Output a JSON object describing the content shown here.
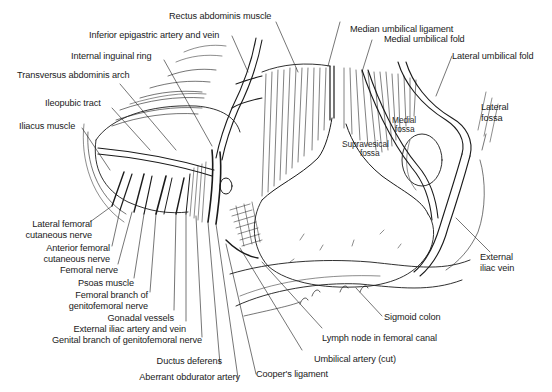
{
  "figure": {
    "type": "anatomical-line-drawing",
    "ink_color": "#1a1a1a",
    "background": "#ffffff"
  },
  "labels": {
    "rectus_abdominis": "Rectus abdominis muscle",
    "inferior_epigastric": "Inferior epigastric artery and vein",
    "internal_inguinal_ring": "Internal inguinal ring",
    "transversus_arch": "Transversus abdominis arch",
    "ileopubic_tract": "Ileopubic tract",
    "iliacus": "Iliacus muscle",
    "lat_fem_cut_1": "Lateral femoral",
    "lat_fem_cut_2": "cutaneous nerve",
    "ant_fem_cut_1": "Anterior femoral",
    "ant_fem_cut_2": "cutaneous nerve",
    "femoral_nerve": "Femoral nerve",
    "psoas": "Psoas muscle",
    "fem_branch_1": "Femoral branch of",
    "fem_branch_2": "genitofemoral nerve",
    "gonadal": "Gonadal vessels",
    "ext_iliac_av": "External iliac artery and vein",
    "genital_branch": "Genital branch of genitofemoral nerve",
    "ductus": "Ductus deferens",
    "aberrant_obturator": "Aberrant obdurator artery",
    "coopers": "Cooper's ligament",
    "umbilical_artery": "Umbilical artery (cut)",
    "lymph_node": "Lymph node in femoral canal",
    "sigmoid": "Sigmoid colon",
    "ext_iliac_vein_1": "External",
    "ext_iliac_vein_2": "iliac vein",
    "lateral_fossa_1": "Lateral",
    "lateral_fossa_2": "fossa",
    "medial_fossa_1": "Medial",
    "medial_fossa_2": "fossa",
    "supravesical_1": "Supravesical",
    "supravesical_2": "fossa",
    "lateral_umbilical_fold": "Lateral umbilical fold",
    "medial_umbilical_fold": "Medial umbilical fold",
    "median_umbilical_ligament": "Median umbilical ligament"
  }
}
